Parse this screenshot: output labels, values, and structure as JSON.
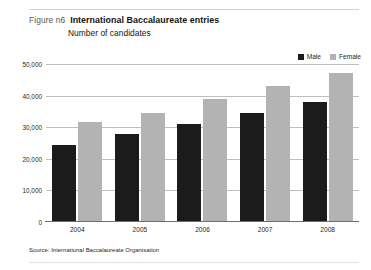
{
  "figure": {
    "label": "Figure n6",
    "title": "International Baccalaureate entries",
    "subtitle": "Number of candidates",
    "source": "Source: International Baccalaureate Organisation"
  },
  "legend": {
    "items": [
      {
        "label": "Male",
        "color": "#1b1b1b",
        "swatch_name": "legend-swatch-male"
      },
      {
        "label": "Female",
        "color": "#b3b3b3",
        "swatch_name": "legend-swatch-female"
      }
    ]
  },
  "axis": {
    "yticks": [
      "50,000",
      "40,000",
      "30,000",
      "20,000",
      "10,000",
      "0"
    ],
    "xticks": [
      "2004",
      "2005",
      "2006",
      "2007",
      "2008"
    ]
  },
  "chart_data": {
    "type": "bar",
    "title": "International Baccalaureate entries",
    "subtitle": "Number of candidates",
    "xlabel": "",
    "ylabel": "Number of candidates",
    "ylim": [
      0,
      50000
    ],
    "ytick_values": [
      0,
      10000,
      20000,
      30000,
      40000,
      50000
    ],
    "grid": true,
    "legend_position": "top-right",
    "categories": [
      "2004",
      "2005",
      "2006",
      "2007",
      "2008"
    ],
    "series": [
      {
        "name": "Male",
        "color": "#1b1b1b",
        "values": [
          24500,
          28000,
          31000,
          34500,
          38000
        ]
      },
      {
        "name": "Female",
        "color": "#b3b3b3",
        "values": [
          31500,
          34500,
          39000,
          43000,
          47000
        ]
      }
    ],
    "source": "International Baccalaureate Organisation"
  }
}
